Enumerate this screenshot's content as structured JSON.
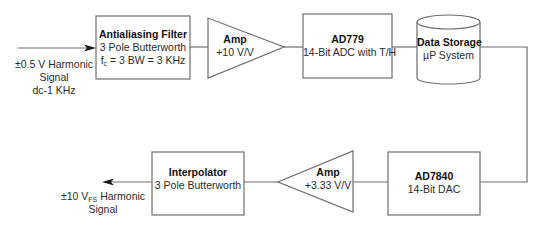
{
  "diagram": {
    "type": "signal-chain-block-diagram",
    "input_signal": {
      "lines": [
        "±0.5 V Harmonic",
        "Signal",
        "dc-1 KHz"
      ]
    },
    "blocks": [
      {
        "id": "antialiasing-filter",
        "shape": "rectangle",
        "title": "Antialiasing Filter",
        "line1": "3 Pole Butterworth",
        "line2_prefix": "f",
        "line2_sub": "c",
        "line2_rest": " = 3 BW = 3 KHz"
      },
      {
        "id": "amp-input",
        "shape": "triangle-right",
        "title": "Amp",
        "line1": "+10 V/V"
      },
      {
        "id": "ad779",
        "shape": "rectangle",
        "title": "AD779",
        "line1": "14-Bit ADC with T/H"
      },
      {
        "id": "data-storage",
        "shape": "cylinder",
        "title": "Data Storage",
        "line1": "µP System"
      },
      {
        "id": "ad7840",
        "shape": "rectangle",
        "title": "AD7840",
        "line1": "14-Bit DAC"
      },
      {
        "id": "amp-output",
        "shape": "triangle-left",
        "title": "Amp",
        "line1": "+3.33 V/V"
      },
      {
        "id": "interpolator",
        "shape": "rectangle",
        "title": "Interpolator",
        "line1": "3 Pole Butterworth"
      }
    ],
    "output_signal": {
      "line1_prefix": "±10 V",
      "line1_sub": "FS",
      "line1_rest": " Harmonic",
      "line2": "Signal"
    },
    "connections": [
      [
        "input",
        "antialiasing-filter"
      ],
      [
        "antialiasing-filter",
        "amp-input"
      ],
      [
        "amp-input",
        "ad779"
      ],
      [
        "ad779",
        "data-storage"
      ],
      [
        "data-storage",
        "ad7840"
      ],
      [
        "ad7840",
        "amp-output"
      ],
      [
        "amp-output",
        "interpolator"
      ],
      [
        "interpolator",
        "output"
      ]
    ],
    "colors": {
      "stroke": "#6e6e6e",
      "fill": "#ffffff",
      "text": "#1a1a1a"
    }
  }
}
